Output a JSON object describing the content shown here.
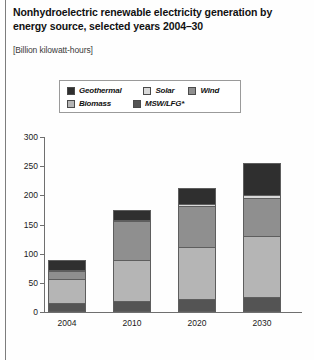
{
  "figure": {
    "title": "Nonhydroelectric renewable electricity generation by energy source, selected years 2004–30",
    "units": "[Billion kilowatt-hours]"
  },
  "legend": {
    "row1": [
      {
        "label": "Geothermal",
        "color": "#2f2f2f"
      },
      {
        "label": "Solar",
        "color": "#d9d9d9"
      },
      {
        "label": "Wind",
        "color": "#8f8f8f"
      }
    ],
    "row2": [
      {
        "label": "Biomass",
        "color": "#b5b5b5"
      },
      {
        "label": "MSW/LFG*",
        "color": "#545454"
      }
    ]
  },
  "chart_data": {
    "type": "bar",
    "stacked": true,
    "title": "Nonhydroelectric renewable electricity generation by energy source, selected years 2004–30",
    "xlabel": "",
    "ylabel": "Billion kilowatt-hours",
    "ylim": [
      0,
      300
    ],
    "yticks": [
      0,
      50,
      100,
      150,
      200,
      250,
      300
    ],
    "ytick_labels": [
      "0",
      "50",
      "100",
      "150",
      "200",
      "250",
      "300"
    ],
    "grid": false,
    "legend_position": "top",
    "categories": [
      "2004",
      "2010",
      "2020",
      "2030"
    ],
    "series": [
      {
        "name": "MSW/LFG*",
        "color": "#545454",
        "values": [
          16,
          19,
          22,
          25
        ]
      },
      {
        "name": "Biomass",
        "color": "#b5b5b5",
        "values": [
          40,
          71,
          90,
          105
        ]
      },
      {
        "name": "Wind",
        "color": "#8f8f8f",
        "values": [
          15,
          66,
          70,
          65
        ]
      },
      {
        "name": "Solar",
        "color": "#d9d9d9",
        "values": [
          1,
          2,
          3,
          5
        ]
      },
      {
        "name": "Geothermal",
        "color": "#2f2f2f",
        "values": [
          16,
          17,
          27,
          55
        ]
      }
    ],
    "totals": [
      88,
      175,
      212,
      255
    ]
  },
  "axis": {
    "y_labels": [
      "300",
      "250",
      "200",
      "150",
      "100",
      "50",
      "0"
    ],
    "x_labels": [
      "2004",
      "2010",
      "2020",
      "2030"
    ]
  }
}
